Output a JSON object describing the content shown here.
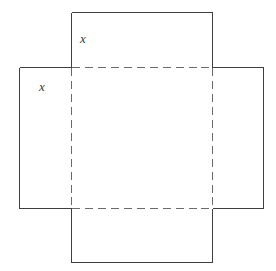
{
  "figure": {
    "stroke_color": "#3f3f3f",
    "dash_color": "#6a6a6a",
    "background": "#ffffff",
    "stroke_width": 1.3,
    "dash_pattern": "8 5",
    "inner_square": {
      "left": 71,
      "top": 67,
      "right": 212,
      "bottom": 208
    },
    "outer_bounds": {
      "left": 19,
      "top": 12,
      "right": 263,
      "bottom": 262
    },
    "labels": [
      {
        "id": "label-x-top",
        "text": "x",
        "x": 80,
        "y": 32
      },
      {
        "id": "label-x-left",
        "text": "x",
        "x": 39,
        "y": 80
      }
    ]
  }
}
